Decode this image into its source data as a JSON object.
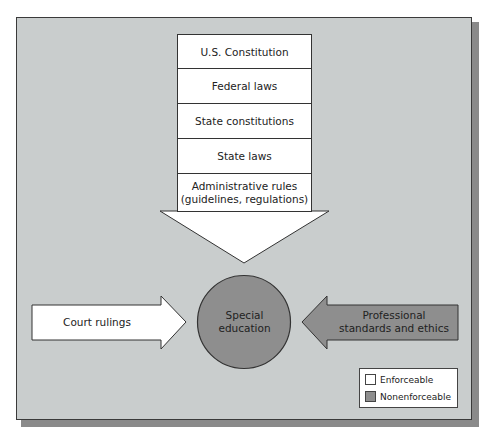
{
  "diagram": {
    "hierarchy": [
      {
        "label": "U.S. Constitution"
      },
      {
        "label": "Federal laws"
      },
      {
        "label": "State constitutions"
      },
      {
        "label": "State laws"
      },
      {
        "label": "Administrative rules\n(guidelines, regulations)"
      }
    ],
    "center": {
      "label_line1": "Special",
      "label_line2": "education"
    },
    "left_arrow": {
      "label": "Court rulings"
    },
    "right_arrow": {
      "label_line1": "Professional",
      "label_line2": "standards and ethics"
    },
    "legend": [
      {
        "label": "Enforceable",
        "color": "#ffffff"
      },
      {
        "label": "Nonenforceable",
        "color": "#8e8e8e"
      }
    ]
  },
  "colors": {
    "background": "#c9cdcd",
    "enforceable": "#ffffff",
    "nonenforceable": "#8e8e8e",
    "outline": "#333333",
    "shadow": "#8a8a8a"
  }
}
